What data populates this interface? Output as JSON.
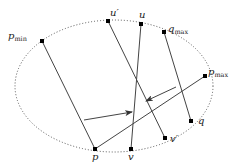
{
  "diagram": {
    "boundary": {
      "shape": "ellipse",
      "style": "dotted",
      "cx": 114,
      "cy": 86,
      "rx": 99,
      "ry": 66
    },
    "points": [
      {
        "id": "p_min",
        "label": "p",
        "sub": "min",
        "x": 42,
        "y": 41,
        "lx": 8,
        "ly": 39
      },
      {
        "id": "u_prime",
        "label": "u′",
        "sub": "",
        "x": 108,
        "y": 21,
        "lx": 110,
        "ly": 16
      },
      {
        "id": "u",
        "label": "u",
        "sub": "",
        "x": 141,
        "y": 24,
        "lx": 139,
        "ly": 18
      },
      {
        "id": "q_max",
        "label": "q",
        "sub": "max",
        "x": 164,
        "y": 32,
        "lx": 168,
        "ly": 32
      },
      {
        "id": "p_max",
        "label": "p",
        "sub": "max",
        "x": 205,
        "y": 76,
        "lx": 208,
        "ly": 75
      },
      {
        "id": "q",
        "label": "q",
        "sub": "",
        "x": 191,
        "y": 121,
        "lx": 198,
        "ly": 124
      },
      {
        "id": "v_prime",
        "label": "v′",
        "sub": "",
        "x": 165,
        "y": 138,
        "lx": 170,
        "ly": 142
      },
      {
        "id": "v",
        "label": "v",
        "sub": "",
        "x": 131,
        "y": 149,
        "lx": 128,
        "ly": 160
      },
      {
        "id": "p",
        "label": "p",
        "sub": "",
        "x": 95,
        "y": 149,
        "lx": 92,
        "ly": 160
      }
    ],
    "segments": [
      {
        "from": "p_min",
        "to": "p"
      },
      {
        "from": "u_prime",
        "to": "v_prime"
      },
      {
        "from": "u",
        "to": "v"
      },
      {
        "from": "q_max",
        "to": "q"
      },
      {
        "from": "p",
        "to": "p_max"
      }
    ],
    "arrows": [
      {
        "x1": 84,
        "y1": 120,
        "x2": 132,
        "y2": 112
      },
      {
        "x1": 176,
        "y1": 87,
        "x2": 146,
        "y2": 101
      }
    ]
  }
}
